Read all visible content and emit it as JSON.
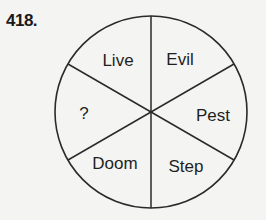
{
  "question": {
    "number": "418."
  },
  "wheel": {
    "stroke_color": "#2a2a2a",
    "segments": [
      {
        "position": "top-left",
        "label": "Live"
      },
      {
        "position": "top-right",
        "label": "Evil"
      },
      {
        "position": "right",
        "label": "Pest"
      },
      {
        "position": "bottom-right",
        "label": "Step"
      },
      {
        "position": "bottom-left",
        "label": "Doom"
      },
      {
        "position": "left",
        "label": "?"
      }
    ]
  }
}
